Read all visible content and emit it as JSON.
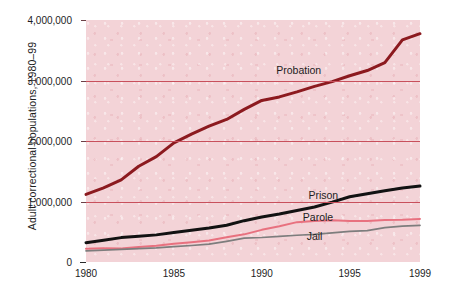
{
  "chart_data": {
    "type": "line",
    "title": "",
    "xlabel": "",
    "ylabel": "Adult correctional populations, 1980–99",
    "xlim": [
      1980,
      1999
    ],
    "ylim": [
      0,
      4000000
    ],
    "grid": true,
    "grid_axis": "y",
    "legend_position": "inline-annotations",
    "x": [
      1980,
      1981,
      1982,
      1983,
      1984,
      1985,
      1986,
      1987,
      1988,
      1989,
      1990,
      1991,
      1992,
      1993,
      1994,
      1995,
      1996,
      1997,
      1998,
      1999
    ],
    "y_ticks": [
      0,
      1000000,
      2000000,
      3000000,
      4000000
    ],
    "y_tick_labels": [
      "0",
      "1,000,000",
      "2,000,000",
      "3,000,000",
      "4,000,000"
    ],
    "x_ticks": [
      1980,
      1985,
      1990,
      1995,
      1999
    ],
    "x_tick_labels": [
      "1980",
      "1985",
      "1990",
      "1995",
      "1999"
    ],
    "series": [
      {
        "name": "Probation",
        "color": "#8c1a1f",
        "label_x": 1992.1,
        "label_y": 3180000,
        "values": [
          1118097,
          1225934,
          1357264,
          1582947,
          1740948,
          1968712,
          2114621,
          2247158,
          2356483,
          2522125,
          2670234,
          2728472,
          2811611,
          2903061,
          2981022,
          3077861,
          3164996,
          3296513,
          3670441,
          3773624
        ]
      },
      {
        "name": "Prison",
        "color": "#121212",
        "label_x": 1993.5,
        "label_y": 1108000,
        "values": [
          319598,
          360029,
          402914,
          423898,
          448264,
          487593,
          526436,
          562814,
          607766,
          683367,
          743382,
          792535,
          850566,
          909381,
          990147,
          1078542,
          1127528,
          1176564,
          1224469,
          1254577
        ]
      },
      {
        "name": "Parole",
        "color": "#e8717f",
        "label_x": 1993.2,
        "label_y": 740000,
        "values": [
          220438,
          225539,
          224604,
          246440,
          266992,
          300203,
          325638,
          355505,
          407977,
          456803,
          531407,
          590442,
          658601,
          676100,
          690371,
          679421,
          679733,
          694787,
          696385,
          712713
        ]
      },
      {
        "name": "Jail",
        "color": "#7d7d7d",
        "label_x": 1993.0,
        "label_y": 430000,
        "values": [
          182288,
          195085,
          207853,
          221815,
          233018,
          254986,
          272736,
          294092,
          341893,
          393303,
          405320,
          424129,
          441781,
          455500,
          479800,
          507044,
          518492,
          567079,
          592462,
          605943
        ]
      }
    ]
  }
}
